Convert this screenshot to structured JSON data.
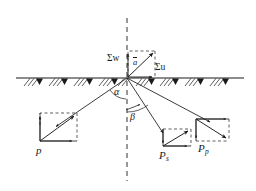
{
  "figure": {
    "background_color": "#ffffff",
    "line_color": "#1a1a1a",
    "width": 256,
    "height": 191
  },
  "labels": {
    "sum_w": "Σw",
    "sum_u": "Σu",
    "a_bar": "a",
    "alpha": "α",
    "beta": "β",
    "p": "p",
    "p_s_main": "P",
    "p_s_sub": "s",
    "p_p_main": "P",
    "p_p_sub": "p"
  },
  "elements": {
    "ground_line": "horizontal-hatched-surface",
    "axis_line": "vertical-dashed-centerline",
    "origin": {
      "x": 127,
      "y": 78
    },
    "rays": [
      {
        "name": "ray-left-p",
        "from": [
          127,
          78
        ],
        "to": [
          46,
          133
        ]
      },
      {
        "name": "ray-right-ps",
        "from": [
          127,
          78
        ],
        "to": [
          168,
          146
        ]
      },
      {
        "name": "ray-right-pp",
        "from": [
          127,
          78
        ],
        "to": [
          216,
          137
        ]
      }
    ],
    "angles": [
      {
        "name": "alpha",
        "between": "ray-left-p and vertical-axis"
      },
      {
        "name": "beta",
        "between": "vertical-axis and ray-right-ps"
      }
    ],
    "vector_boxes": [
      {
        "name": "a-bar-box",
        "label": "a"
      },
      {
        "name": "p-box",
        "label": "p"
      },
      {
        "name": "ps-box",
        "label": "Ps"
      },
      {
        "name": "pp-box",
        "label": "Pp"
      }
    ]
  }
}
